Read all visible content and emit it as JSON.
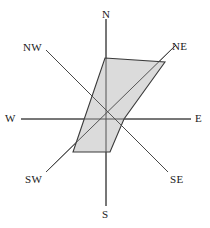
{
  "figure": {
    "title": "",
    "background_color": "#ffffff",
    "width": 210,
    "height": 228
  },
  "chart_data": {
    "type": "radar",
    "title": "",
    "subtitle": "",
    "xlabel": "",
    "ylabel": "",
    "grid": false,
    "legend": null,
    "center": {
      "x": 106,
      "y": 119
    },
    "axis_length": 100,
    "categories": [
      "N",
      "NE",
      "E",
      "SE",
      "S",
      "SW",
      "W",
      "NW"
    ],
    "angles_deg": [
      90,
      45,
      0,
      315,
      270,
      225,
      180,
      135
    ],
    "values": [
      61,
      82,
      18,
      0,
      33,
      57,
      0,
      0
    ],
    "value_max": 100,
    "series": [
      {
        "name": "frequency",
        "values": [
          61,
          82,
          18,
          0,
          33,
          57,
          0,
          0
        ]
      }
    ],
    "polygon_points_px": [
      [
        105,
        58
      ],
      [
        165,
        62
      ],
      [
        124,
        119
      ],
      [
        110,
        152
      ],
      [
        73,
        152
      ]
    ],
    "polygon_fill": "#d9d9d9",
    "polygon_stroke": "#3a3a3a",
    "axis_line_color": "#3a3a3a",
    "axis_line_width": 1
  },
  "axes": {
    "lines": [
      {
        "name": "axis-n-s",
        "x1": 106,
        "y1": 19,
        "x2": 106,
        "y2": 206
      },
      {
        "name": "axis-w-e",
        "x1": 21,
        "y1": 119,
        "x2": 191,
        "y2": 119
      },
      {
        "name": "axis-nw-se",
        "x1": 46,
        "y1": 50,
        "x2": 168,
        "y2": 172
      },
      {
        "name": "axis-sw-ne",
        "x1": 46,
        "y1": 172,
        "x2": 176,
        "y2": 45
      }
    ]
  },
  "labels": {
    "n": {
      "text": "N",
      "left": 102,
      "top": 9
    },
    "ne": {
      "text": "NE",
      "left": 172,
      "top": 41
    },
    "e": {
      "text": "E",
      "left": 195,
      "top": 113
    },
    "se": {
      "text": "SE",
      "left": 170,
      "top": 174
    },
    "s": {
      "text": "S",
      "left": 102,
      "top": 209
    },
    "sw": {
      "text": "SW",
      "left": 25,
      "top": 174
    },
    "w": {
      "text": "W",
      "left": 5,
      "top": 113
    },
    "nw": {
      "text": "NW",
      "left": 23,
      "top": 42
    }
  }
}
